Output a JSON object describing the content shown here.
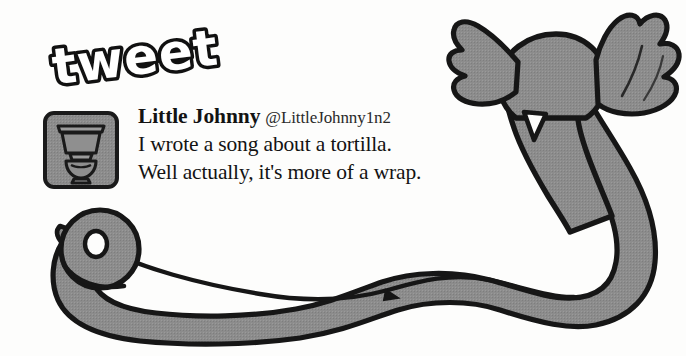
{
  "logo": {
    "text": "tweet",
    "style": "bubble-outline",
    "fill_color": "#ffffff",
    "outline_color": "#111111"
  },
  "tweet": {
    "avatar": {
      "icon": "toilet-icon",
      "fill_color": "#8a8a8a",
      "outline_color": "#1a1a1a"
    },
    "display_name": "Little Johnny",
    "handle": "@LittleJohnny1n2",
    "lines": [
      "I wrote a song about a tortilla.",
      "Well actually, it's more of a wrap."
    ]
  },
  "illustration": {
    "name": "flying-toilet-paper-bird",
    "parts": [
      "bird-body",
      "left-wing",
      "right-wing",
      "toilet-paper-roll",
      "unrolled-paper-ribbon"
    ],
    "fill_color": "#8c8c8c",
    "outline_color": "#161616",
    "background_color": "#fdfdfc"
  }
}
